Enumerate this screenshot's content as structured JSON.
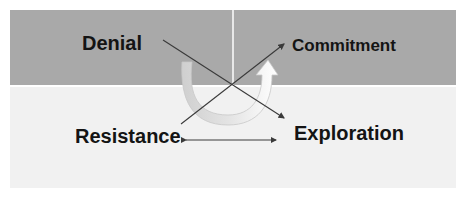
{
  "diagram": {
    "quadrants": {
      "top_left": "Denial",
      "top_right": "Commitment",
      "bottom_left": "Resistance",
      "bottom_right": "Exploration"
    },
    "colors": {
      "top_band": "#a9a9a9",
      "bottom_band": "#f1f1f1",
      "lines": "#3a3a3a",
      "curved_arrow": "#ffffff"
    },
    "connectors": [
      {
        "from": "Denial",
        "to": "Exploration",
        "type": "arrow"
      },
      {
        "from": "Resistance",
        "to": "Commitment",
        "type": "arrow"
      },
      {
        "from": "Resistance",
        "to": "Exploration",
        "type": "double-arrow"
      },
      {
        "from": "Denial",
        "to": "Commitment",
        "type": "curved-u-arrow"
      }
    ]
  }
}
